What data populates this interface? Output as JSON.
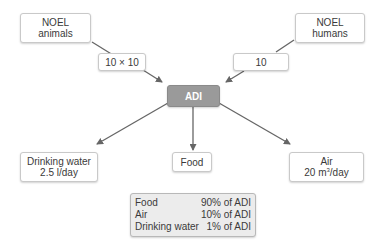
{
  "diagram": {
    "nodes": {
      "noel_animals": {
        "line1": "NOEL",
        "line2": "animals"
      },
      "noel_humans": {
        "line1": "NOEL",
        "line2": "humans"
      },
      "factor_animals": {
        "label": "10 × 10"
      },
      "factor_humans": {
        "label": "10"
      },
      "adi": {
        "label": "ADI"
      },
      "drinking_water": {
        "line1": "Drinking water",
        "line2": "2.5 l/day"
      },
      "food": {
        "label": "Food"
      },
      "air": {
        "line1": "Air",
        "line2_prefix": "20 m",
        "line2_sup": "3",
        "line2_suffix": "/day"
      }
    },
    "summary": {
      "rows": [
        {
          "source": "Food",
          "share": "90% of ADI"
        },
        {
          "source": "Air",
          "share": "10% of ADI"
        },
        {
          "source": "Drinking water",
          "share": "1% of ADI"
        }
      ]
    },
    "colors": {
      "adi_fill": "#9a9a9a",
      "arrow": "#666666",
      "summary_fill": "#ececec"
    }
  }
}
